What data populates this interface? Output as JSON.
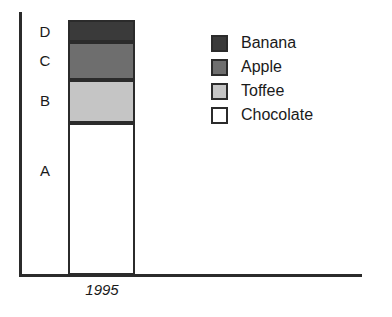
{
  "chart_data": {
    "type": "bar",
    "title": "",
    "subtitle": "",
    "xlabel": "",
    "ylabel": "",
    "stacked": true,
    "orientation": "vertical",
    "grid": false,
    "legend_position": "right",
    "categories": [
      "1995"
    ],
    "x_tick_labels": [
      "1995"
    ],
    "y_tick_labels": [],
    "ylim": [
      0,
      100
    ],
    "segment_labels": [
      "A",
      "B",
      "C",
      "D"
    ],
    "series": [
      {
        "name": "Chocolate",
        "segment": "A",
        "values": [
          60
        ],
        "color": "#ffffff"
      },
      {
        "name": "Toffee",
        "segment": "B",
        "values": [
          17
        ],
        "color": "#c5c5c5"
      },
      {
        "name": "Apple",
        "segment": "C",
        "values": [
          15
        ],
        "color": "#6e6e6e"
      },
      {
        "name": "Banana",
        "segment": "D",
        "values": [
          8
        ],
        "color": "#3a3a3a"
      }
    ],
    "annotations": []
  },
  "axes": {
    "x_axis_name": "x-axis-line",
    "y_axis_name": "y-axis-line",
    "x_tick_label": "1995"
  },
  "bar": {
    "segments": [
      {
        "key": "d",
        "label": "D",
        "series": "Banana",
        "color": "#3a3a3a",
        "value": 8
      },
      {
        "key": "c",
        "label": "C",
        "series": "Apple",
        "color": "#6e6e6e",
        "value": 15
      },
      {
        "key": "b",
        "label": "B",
        "series": "Toffee",
        "color": "#c5c5c5",
        "value": 17
      },
      {
        "key": "a",
        "label": "A",
        "series": "Chocolate",
        "color": "#ffffff",
        "value": 60
      }
    ]
  },
  "legend": {
    "items": [
      {
        "label": "Banana",
        "color": "#3a3a3a"
      },
      {
        "label": "Apple",
        "color": "#6e6e6e"
      },
      {
        "label": "Toffee",
        "color": "#c5c5c5"
      },
      {
        "label": "Chocolate",
        "color": "#ffffff"
      }
    ]
  },
  "colors": {
    "axis": "#2b2b2b",
    "outline": "#2b2b2b",
    "text": "#1a1a1a",
    "background": "#ffffff"
  }
}
